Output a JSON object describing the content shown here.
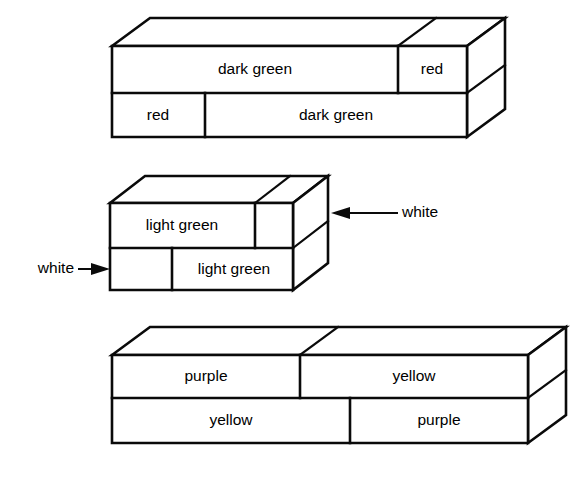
{
  "figure": {
    "background_color": "#ffffff",
    "line_color": "#0a0a0a",
    "rods": [
      {
        "id": "dark-green-red",
        "top_row": [
          "dark green",
          "red"
        ],
        "bottom_row": [
          "red",
          "dark green"
        ]
      },
      {
        "id": "light-green-white",
        "top_row": [
          "light green",
          "white"
        ],
        "bottom_row": [
          "white",
          "light green"
        ]
      },
      {
        "id": "purple-yellow",
        "top_row": [
          "purple",
          "yellow"
        ],
        "bottom_row": [
          "yellow",
          "purple"
        ]
      }
    ]
  },
  "block1": {
    "top_left_label": "dark green",
    "top_right_label": "red",
    "bottom_left_label": "red",
    "bottom_right_label": "dark green"
  },
  "block2": {
    "top_left_label": "light green",
    "bottom_right_label": "light green",
    "callout_right_label": "white",
    "callout_left_label": "white"
  },
  "block3": {
    "top_left_label": "purple",
    "top_right_label": "yellow",
    "bottom_left_label": "yellow",
    "bottom_right_label": "purple"
  }
}
